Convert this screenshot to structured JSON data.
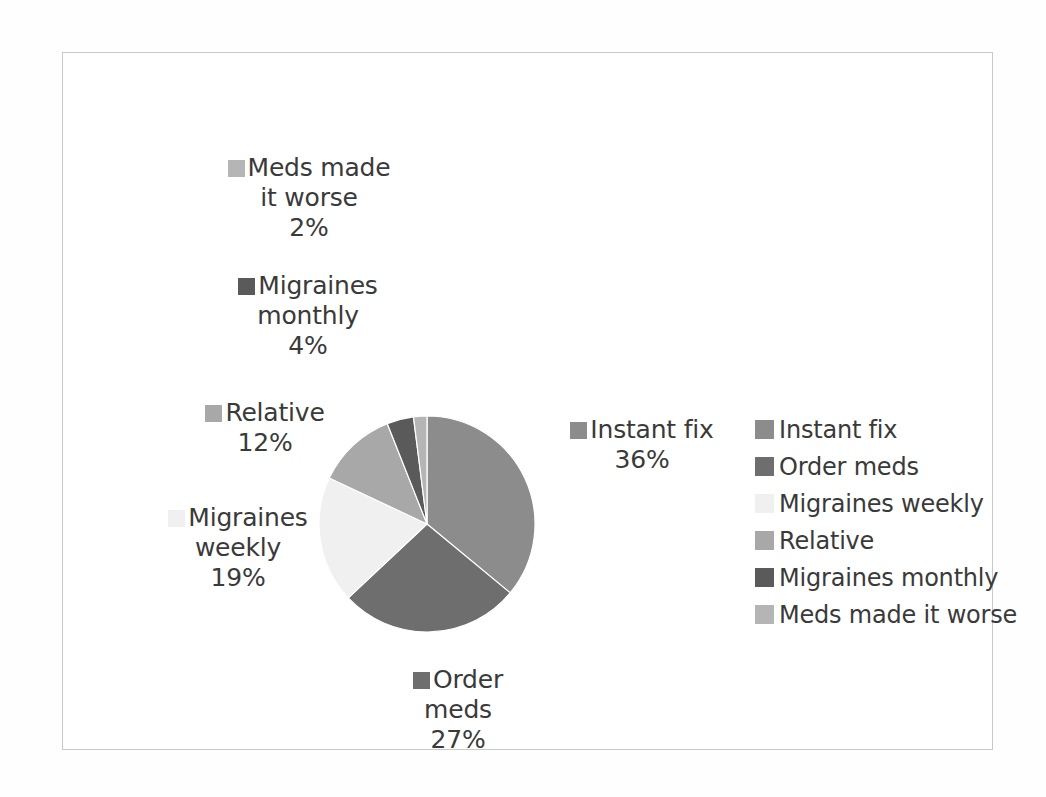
{
  "chart_data": {
    "type": "pie",
    "title": "",
    "categories": [
      "Instant fix",
      "Order meds",
      "Migraines weekly",
      "Relative",
      "Migraines monthly",
      "Meds made it worse"
    ],
    "values": [
      36,
      27,
      19,
      12,
      4,
      2
    ],
    "value_unit": "%",
    "value_labels": [
      "36%",
      "27%",
      "19%",
      "12%",
      "4%",
      "2%"
    ],
    "colors": [
      "#8c8c8c",
      "#6e6e6e",
      "#f0f0f0",
      "#a8a8a8",
      "#5a5a5a",
      "#b5b5b5"
    ],
    "start_angle_deg": 0,
    "direction": "clockwise",
    "legend_position": "right",
    "grid": false,
    "xlabel": "",
    "ylabel": ""
  },
  "labels": {
    "meds_worse": {
      "line1": "Meds made",
      "line2": "it worse",
      "value": "2%",
      "color": "#b5b5b5"
    },
    "migraines_monthly": {
      "line1": "Migraines",
      "line2": "monthly",
      "value": "4%",
      "color": "#5a5a5a"
    },
    "relative": {
      "line1": "Relative",
      "line2": "",
      "value": "12%",
      "color": "#a8a8a8"
    },
    "migraines_weekly": {
      "line1": "Migraines",
      "line2": "weekly",
      "value": "19%",
      "color": "#f0f0f0"
    },
    "order_meds": {
      "line1": "Order",
      "line2": "meds",
      "value": "27%",
      "color": "#6e6e6e"
    },
    "instant_fix": {
      "line1": "Instant fix",
      "line2": "",
      "value": "36%",
      "color": "#8c8c8c"
    }
  },
  "legend": {
    "items": [
      {
        "label": "Instant fix",
        "color": "#8c8c8c"
      },
      {
        "label": "Order meds",
        "color": "#6e6e6e"
      },
      {
        "label": "Migraines weekly",
        "color": "#f0f0f0"
      },
      {
        "label": "Relative",
        "color": "#a8a8a8"
      },
      {
        "label": "Migraines monthly",
        "color": "#5a5a5a"
      },
      {
        "label": "Meds made it worse",
        "color": "#b5b5b5"
      }
    ]
  }
}
